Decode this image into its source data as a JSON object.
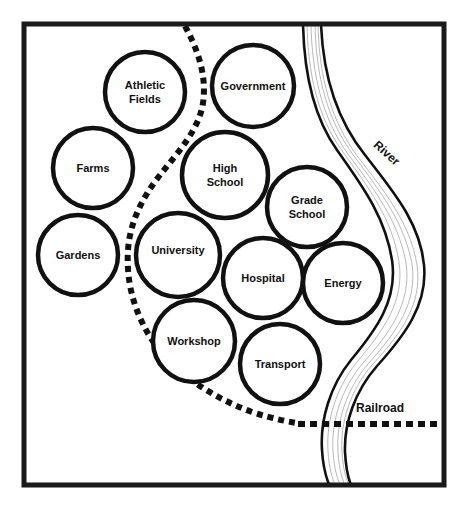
{
  "diagram": {
    "frame": {
      "x": 24,
      "y": 24,
      "width": 420,
      "height": 461,
      "stroke": "#1a1a1a",
      "stroke_width": 5
    },
    "background_color": "#ffffff",
    "ink_color": "#111111"
  },
  "zones": [
    {
      "id": "athletic-fields",
      "label_lines": [
        "Athletic",
        "Fields"
      ],
      "cx": 145,
      "cy": 92,
      "r": 40,
      "font_size": 11
    },
    {
      "id": "government",
      "label_lines": [
        "Government"
      ],
      "cx": 253,
      "cy": 86,
      "r": 41,
      "font_size": 11
    },
    {
      "id": "farms",
      "label_lines": [
        "Farms"
      ],
      "cx": 93,
      "cy": 168,
      "r": 40,
      "font_size": 11
    },
    {
      "id": "high-school",
      "label_lines": [
        "High",
        "School"
      ],
      "cx": 225,
      "cy": 175,
      "r": 43,
      "font_size": 11
    },
    {
      "id": "grade-school",
      "label_lines": [
        "Grade",
        "School"
      ],
      "cx": 307,
      "cy": 207,
      "r": 40,
      "font_size": 11
    },
    {
      "id": "gardens",
      "label_lines": [
        "Gardens"
      ],
      "cx": 78,
      "cy": 255,
      "r": 40,
      "font_size": 11
    },
    {
      "id": "university",
      "label_lines": [
        "University"
      ],
      "cx": 178,
      "cy": 255,
      "r": 42,
      "font_size": 11
    },
    {
      "id": "hospital",
      "label_lines": [
        "Hospital"
      ],
      "cx": 263,
      "cy": 278,
      "r": 40,
      "font_size": 11
    },
    {
      "id": "energy",
      "label_lines": [
        "Energy"
      ],
      "cx": 343,
      "cy": 283,
      "r": 40,
      "font_size": 11
    },
    {
      "id": "workshop",
      "label_lines": [
        "Workshop"
      ],
      "cx": 194,
      "cy": 341,
      "r": 41,
      "font_size": 11
    },
    {
      "id": "transport",
      "label_lines": [
        "Transport"
      ],
      "cx": 280,
      "cy": 364,
      "r": 40,
      "font_size": 11
    }
  ],
  "features": {
    "river": {
      "label": "River",
      "label_x": 384,
      "label_y": 156,
      "label_rotation": 42,
      "font_size": 12,
      "bank_stroke_width": 2.6,
      "stream_stroke_width": 0.7,
      "stream_color": "#9a9a9a"
    },
    "railroad": {
      "label": "Railroad",
      "label_x": 356,
      "label_y": 412,
      "font_size": 12,
      "y": 424,
      "x_start": 300,
      "x_end": 440,
      "dash_pattern": "7 5",
      "stroke_width": 6
    },
    "boundary": {
      "label": "",
      "dash_pattern": "6 5",
      "stroke_width": 6
    }
  }
}
